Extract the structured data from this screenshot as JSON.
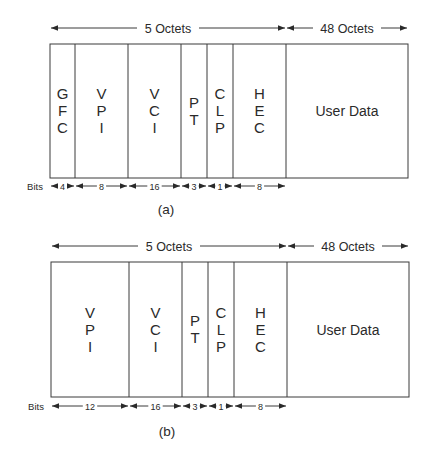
{
  "diagrams": [
    {
      "id": "a",
      "caption": "(a)",
      "header_label": "5 Octets",
      "payload_label": "48 Octets",
      "bits_label": "Bits",
      "fields": [
        {
          "name": "GFC",
          "letters": [
            "G",
            "F",
            "C"
          ],
          "bits": "4"
        },
        {
          "name": "VPI",
          "letters": [
            "V",
            "P",
            "I"
          ],
          "bits": "8"
        },
        {
          "name": "VCI",
          "letters": [
            "V",
            "C",
            "I"
          ],
          "bits": "16"
        },
        {
          "name": "PT",
          "letters": [
            "P",
            "T"
          ],
          "bits": "3"
        },
        {
          "name": "CLP",
          "letters": [
            "C",
            "L",
            "P"
          ],
          "bits": "1"
        },
        {
          "name": "HEC",
          "letters": [
            "H",
            "E",
            "C"
          ],
          "bits": "8"
        }
      ],
      "user_data": "User Data"
    },
    {
      "id": "b",
      "caption": "(b)",
      "header_label": "5 Octets",
      "payload_label": "48 Octets",
      "bits_label": "Bits",
      "fields": [
        {
          "name": "VPI",
          "letters": [
            "V",
            "P",
            "I"
          ],
          "bits": "12"
        },
        {
          "name": "VCI",
          "letters": [
            "V",
            "C",
            "I"
          ],
          "bits": "16"
        },
        {
          "name": "PT",
          "letters": [
            "P",
            "T"
          ],
          "bits": "3"
        },
        {
          "name": "CLP",
          "letters": [
            "C",
            "L",
            "P"
          ],
          "bits": "1"
        },
        {
          "name": "HEC",
          "letters": [
            "H",
            "E",
            "C"
          ],
          "bits": "8"
        }
      ],
      "user_data": "User Data"
    }
  ],
  "layout": {
    "a": {
      "left": 50,
      "right": 408,
      "top": 44,
      "bottom": 178,
      "dividers": [
        75,
        128,
        181,
        207,
        233,
        286
      ],
      "octet_y": 28,
      "bits_y": 186,
      "caption_y": 214
    },
    "b": {
      "left": 51,
      "right": 409,
      "top": 262,
      "bottom": 397,
      "dividers": [
        129,
        182,
        208,
        234,
        287
      ],
      "octet_y": 246,
      "bits_y": 406,
      "caption_y": 436
    }
  },
  "colors": {
    "line": "#3a3a3a",
    "text": "#2a2a2a"
  }
}
